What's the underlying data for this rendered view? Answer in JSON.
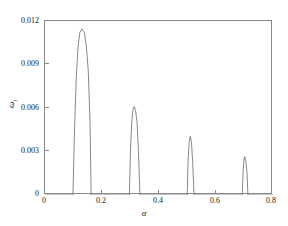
{
  "chart_data": {
    "type": "line",
    "title": "",
    "xlabel": "α",
    "ylabel": "ω",
    "ylabel_sub": "i",
    "xlim": [
      0,
      0.8
    ],
    "ylim": [
      0,
      0.012
    ],
    "grid": false,
    "legend": null,
    "line_color": "#7a7a7a",
    "axis_color": "#8a8a8a",
    "background": "#ffffff",
    "xticks": [
      {
        "value": 0,
        "label": "0"
      },
      {
        "value": 0.2,
        "label": "0.2"
      },
      {
        "value": 0.4,
        "label": "0.4"
      },
      {
        "value": 0.6,
        "label": "0.6"
      },
      {
        "value": 0.8,
        "label": "0.8"
      }
    ],
    "yticks": [
      {
        "value": 0,
        "label": "0"
      },
      {
        "value": 0.003,
        "label": "0.003"
      },
      {
        "value": 0.006,
        "label": "0.006"
      },
      {
        "value": 0.009,
        "label": "0.009"
      },
      {
        "value": 0.012,
        "label": "0.012"
      }
    ],
    "lobes": [
      {
        "name": "lobe-1",
        "x_start": 0.098,
        "x_peak": 0.13,
        "x_end": 0.162,
        "peak_value": 0.01145
      },
      {
        "name": "lobe-2",
        "x_start": 0.296,
        "x_peak": 0.313,
        "x_end": 0.333,
        "peak_value": 0.0061
      },
      {
        "name": "lobe-3",
        "x_start": 0.499,
        "x_peak": 0.51,
        "x_end": 0.523,
        "peak_value": 0.00405
      },
      {
        "name": "lobe-4",
        "x_start": 0.692,
        "x_peak": 0.701,
        "x_end": 0.712,
        "peak_value": 0.00265
      }
    ],
    "series": [
      {
        "name": "omega_i",
        "x": [
          0.0,
          0.098,
          0.104,
          0.11,
          0.116,
          0.122,
          0.13,
          0.138,
          0.145,
          0.152,
          0.158,
          0.162,
          0.296,
          0.3,
          0.305,
          0.309,
          0.313,
          0.318,
          0.323,
          0.328,
          0.333,
          0.499,
          0.502,
          0.506,
          0.51,
          0.514,
          0.518,
          0.523,
          0.692,
          0.695,
          0.698,
          0.701,
          0.705,
          0.709,
          0.712,
          0.8
        ],
        "y": [
          0.0,
          0.0,
          0.0048,
          0.0082,
          0.0102,
          0.0112,
          0.01145,
          0.0112,
          0.0103,
          0.0085,
          0.005,
          0.0,
          0.0,
          0.0032,
          0.0052,
          0.0059,
          0.0061,
          0.0058,
          0.005,
          0.003,
          0.0,
          0.0,
          0.0024,
          0.0037,
          0.00405,
          0.0036,
          0.0023,
          0.0,
          0.0,
          0.0016,
          0.0024,
          0.00265,
          0.0023,
          0.0015,
          0.0,
          0.0
        ]
      }
    ]
  }
}
